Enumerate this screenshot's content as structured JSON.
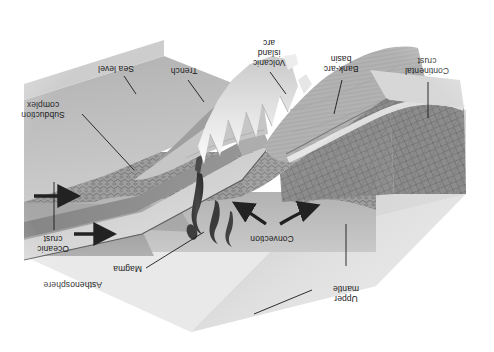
{
  "figure": {
    "kind": "block-diagram",
    "orientation": "rotated-180",
    "background_color": "#ffffff"
  },
  "labels": {
    "upper_mantle": "Upper\nmantle",
    "convection": "Convection",
    "magma": "Magma",
    "asthenosphere": "Asthenosphere",
    "oceanic_crust": "Oceanic\ncrust",
    "subduction_complex": "Subduction\ncomplex",
    "sea_level": "Sea level",
    "trench": "Trench",
    "volcanic_island_arc": "Volcanic\nisland\narc",
    "back_arc_basin": "Bank-arc\nbasin",
    "continental_crust": "Continental\ncrust"
  },
  "colors": {
    "paper": "#ffffff",
    "sky_face": "#e6e6e6",
    "upper_mantle_light": "#cfcfcf",
    "upper_mantle_mid": "#b9b9b9",
    "asthenosphere": "#a8a8a8",
    "oceanic_crust": "#8f8f8f",
    "lithosphere_band": "#d8d8d8",
    "continental_crust": "#7f7f7f",
    "sea_surface": "#bdbdbd",
    "basin_floor": "#b4b4b4",
    "magma": "#3a3a3a",
    "leader_line": "#1a1a1a",
    "arrow": "#222222",
    "text": "#1a1a1a"
  },
  "annotations": {
    "plate_motion_arrows": 2,
    "plate_motion_direction": "left",
    "convection_arrows": 2,
    "magma_plumes": 4
  }
}
